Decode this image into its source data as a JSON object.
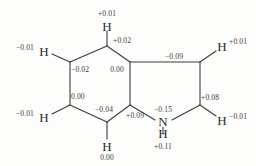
{
  "figure": {
    "molecule": "indoline (2,3-dihydro-1H-indole)",
    "background_color": "#fdfdfc",
    "bond_color": "#3c3c3c",
    "text_color": "#2b2b2b"
  },
  "atoms": {
    "h_top": "H",
    "h_upper_left": "H",
    "h_lower_left": "H",
    "h_bottom": "H",
    "h_upper_right": "H",
    "h_lower_right": "H",
    "n_label": "N",
    "n_hydrogen": "H"
  },
  "charges": {
    "h_top": "+0.01",
    "c_top": "+0.02",
    "h_upper_left": "−0.01",
    "c_upper_left": "−0.02",
    "c_fusion_top": "0.00",
    "c_upper_right": "−0.09",
    "h_upper_right": "+0.01",
    "c_lower_left": "0.00",
    "h_lower_left": "−0.01",
    "c_bottom": "−0.04",
    "h_bottom": "0.00",
    "c_fusion_bottom": "+0.09",
    "n": "−0.15",
    "n_hydrogen": "+0.11",
    "c_lower_right": "+0.08",
    "h_lower_right": "−0.01"
  }
}
